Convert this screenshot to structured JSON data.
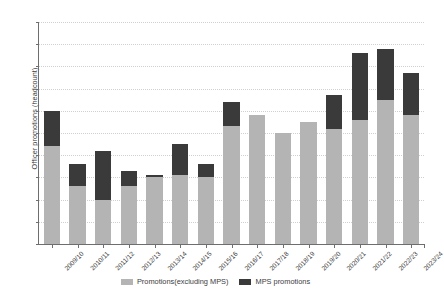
{
  "chart_data": {
    "type": "bar",
    "stacked": true,
    "title": "",
    "xlabel": "",
    "ylabel": "Officer promotions (headcount)",
    "ylim": [
      0,
      5000
    ],
    "ytick_step": 500,
    "grid": true,
    "legend_position": "bottom",
    "categories": [
      "2009/10",
      "2010/11",
      "2011/12",
      "2012/13",
      "2013/14",
      "2014/15",
      "2015/16",
      "2016/17",
      "2017/18",
      "2018/19",
      "2019/20",
      "2020/21",
      "2021/22",
      "2022/23",
      "2023/24"
    ],
    "ytick_labels": [
      "0",
      "500",
      "1,000",
      "1,500",
      "2,000",
      "2,500",
      "3,000",
      "3,500",
      "4,000",
      "4,500",
      "5,000"
    ],
    "ytick_values": [
      0,
      500,
      1000,
      1500,
      2000,
      2500,
      3000,
      3500,
      4000,
      4500,
      5000
    ],
    "series": [
      {
        "name": "Promotions(excluding MPS)",
        "color": "#b4b4b4",
        "values": [
          2200,
          1300,
          1000,
          1300,
          1500,
          1550,
          1500,
          2650,
          2900,
          2500,
          2750,
          2600,
          2800,
          3250,
          2900
        ]
      },
      {
        "name": "MPS promotions",
        "color": "#3a3a3a",
        "values": [
          800,
          500,
          1100,
          350,
          50,
          700,
          300,
          550,
          0,
          0,
          0,
          750,
          1500,
          1150,
          950
        ]
      }
    ],
    "totals": [
      3000,
      1800,
      2100,
      1650,
      1550,
      2250,
      1800,
      3200,
      2900,
      2500,
      2750,
      3350,
      4300,
      4400,
      3850
    ]
  },
  "legend": {
    "items": [
      {
        "label": "Promotions(excluding MPS)",
        "color": "#b4b4b4"
      },
      {
        "label": "MPS promotions",
        "color": "#3a3a3a"
      }
    ]
  },
  "axis": {
    "y_title": "Officer promotions (headcount)"
  }
}
